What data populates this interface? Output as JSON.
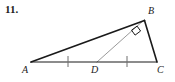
{
  "problem": {
    "number": "11."
  },
  "figure": {
    "name": "right-triangle-with-median-diagram",
    "shape_type": "triangle",
    "stroke_color": "#1a1a1a",
    "median_color": "#8c8c8c",
    "background": "#ffffff",
    "vertices": [
      {
        "id": "A",
        "label": "A",
        "x": 31,
        "y": 62,
        "label_x": 23,
        "label_y": 66
      },
      {
        "id": "B",
        "label": "B",
        "x": 144,
        "y": 20,
        "label_x": 149,
        "label_y": 8
      },
      {
        "id": "C",
        "label": "C",
        "x": 157,
        "y": 62,
        "label_x": 158,
        "label_y": 66
      },
      {
        "id": "D",
        "label": "D",
        "x": 97,
        "y": 62,
        "label_x": 92,
        "label_y": 66
      }
    ],
    "segments": [
      {
        "id": "AB",
        "from": "A",
        "to": "B",
        "style": "solid-dark",
        "width": 1.6
      },
      {
        "id": "BC",
        "from": "B",
        "to": "C",
        "style": "solid-dark",
        "width": 1.6
      },
      {
        "id": "AC",
        "from": "A",
        "to": "C",
        "style": "solid-dark",
        "width": 1.3
      },
      {
        "id": "BD",
        "from": "B",
        "to": "D",
        "style": "solid-gray",
        "width": 1.0
      }
    ],
    "tick_marks": [
      {
        "id": "tick-AD",
        "on_segment": "AD",
        "x": 68,
        "y": 62,
        "count": 1
      },
      {
        "id": "tick-DC",
        "on_segment": "DC",
        "x": 127,
        "y": 62,
        "count": 1
      }
    ],
    "right_angle": {
      "id": "right-angle-at-B",
      "at_vertex": "B",
      "between": [
        "BA",
        "BD"
      ],
      "marker": "square"
    }
  }
}
